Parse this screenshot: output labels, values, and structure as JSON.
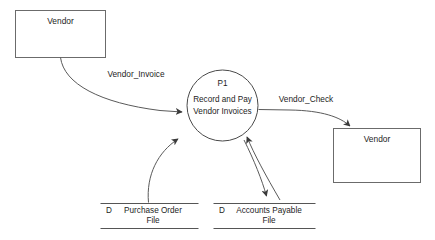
{
  "diagram": {
    "type": "data-flow-diagram",
    "background_color": "#ffffff",
    "line_color": "#5a5a5a",
    "text_color": "#1d1d1d"
  },
  "entities": [
    {
      "id": "vendor-source",
      "label": "Vendor",
      "role": "external-entity",
      "position": "top-left"
    },
    {
      "id": "vendor-sink",
      "label": "Vendor",
      "role": "external-entity",
      "position": "right"
    }
  ],
  "process": {
    "id": "P1",
    "id_label": "P1",
    "name_line1": "Record and Pay",
    "name_line2": "Vendor Invoices"
  },
  "data_stores": [
    {
      "id": "purchase-order-file",
      "prefix": "D",
      "label_line1": "Purchase Order",
      "label_line2": "File"
    },
    {
      "id": "accounts-payable-file",
      "prefix": "D",
      "label_line1": "Accounts Payable",
      "label_line2": "File"
    }
  ],
  "flows": [
    {
      "id": "vendor-invoice",
      "label": "Vendor_Invoice",
      "from": "vendor-source",
      "to": "P1"
    },
    {
      "id": "vendor-check",
      "label": "Vendor_Check",
      "from": "P1",
      "to": "vendor-sink"
    },
    {
      "id": "purchase-order-read",
      "label": "",
      "from": "purchase-order-file",
      "to": "P1"
    },
    {
      "id": "accounts-payable-read",
      "label": "",
      "from": "accounts-payable-file",
      "to": "P1"
    },
    {
      "id": "accounts-payable-write",
      "label": "",
      "from": "P1",
      "to": "accounts-payable-file"
    }
  ]
}
